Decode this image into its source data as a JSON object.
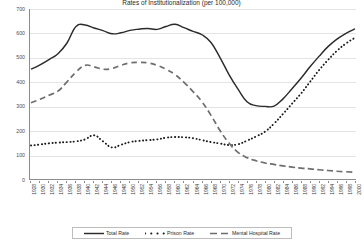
{
  "chart_data": {
    "type": "line",
    "title": "Rates of Institutionalization (per 100,000)",
    "xlabel": "",
    "ylabel": "",
    "ylim": [
      0,
      700
    ],
    "yticks": [
      0,
      100,
      200,
      300,
      400,
      500,
      600,
      700
    ],
    "grid": true,
    "legend_position": "bottom",
    "x": [
      1928,
      1930,
      1932,
      1934,
      1936,
      1938,
      1940,
      1942,
      1944,
      1946,
      1948,
      1950,
      1952,
      1954,
      1956,
      1958,
      1960,
      1962,
      1964,
      1966,
      1968,
      1970,
      1972,
      1974,
      1976,
      1978,
      1980,
      1982,
      1984,
      1986,
      1988,
      1990,
      1992,
      1994,
      1996,
      1998,
      2000
    ],
    "categories": [
      "1928",
      "1930",
      "1932",
      "1934",
      "1936",
      "1938",
      "1940",
      "1942",
      "1944",
      "1946",
      "1948",
      "1950",
      "1952",
      "1954",
      "1956",
      "1958",
      "1960",
      "1962",
      "1964",
      "1966",
      "1968",
      "1970",
      "1972",
      "1974",
      "1976",
      "1978",
      "1980",
      "1982",
      "1984",
      "1986",
      "1988",
      "1990",
      "1992",
      "1994",
      "1996",
      "1998",
      "2000"
    ],
    "series": [
      {
        "name": "Total Rate",
        "style": "solid",
        "color": "#2b2b2b",
        "values": [
          452,
          470,
          492,
          516,
          560,
          628,
          634,
          622,
          611,
          598,
          602,
          612,
          617,
          620,
          616,
          628,
          637,
          623,
          608,
          594,
          562,
          500,
          430,
          370,
          318,
          302,
          299,
          300,
          330,
          372,
          415,
          462,
          505,
          545,
          576,
          600,
          618
        ]
      },
      {
        "name": "Prison Rate",
        "style": "dotted",
        "color": "#1a1a1a",
        "values": [
          138,
          142,
          147,
          150,
          152,
          155,
          163,
          180,
          155,
          130,
          141,
          152,
          157,
          160,
          163,
          170,
          173,
          172,
          168,
          160,
          152,
          146,
          140,
          143,
          158,
          175,
          195,
          228,
          268,
          310,
          352,
          400,
          448,
          490,
          528,
          558,
          582
        ]
      },
      {
        "name": "Mental Hospital Rate",
        "style": "dashed",
        "color": "#6e6e6e",
        "values": [
          314,
          328,
          345,
          362,
          400,
          440,
          468,
          462,
          452,
          455,
          468,
          478,
          480,
          478,
          468,
          452,
          430,
          398,
          360,
          318,
          262,
          200,
          148,
          110,
          88,
          75,
          66,
          60,
          54,
          49,
          45,
          42,
          38,
          35,
          32,
          30,
          28
        ]
      }
    ]
  },
  "legend": {
    "items": [
      {
        "label": "Total Rate",
        "style": "solid"
      },
      {
        "label": "Prison Rate",
        "style": "dotted"
      },
      {
        "label": "Mental Hospital Rate",
        "style": "dashed"
      }
    ]
  }
}
